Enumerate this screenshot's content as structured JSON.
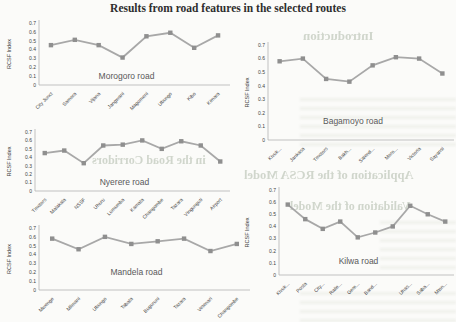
{
  "page_title": "Results from road features in the selected routes",
  "axis": {
    "ylabel": "RCSF Index",
    "ytick_values": [
      0.7,
      0.6,
      0.5,
      0.4,
      0.3,
      0.2,
      0.1,
      0
    ],
    "ytick_labels": [
      "0.7",
      "0.6",
      "0.5",
      "0.4",
      "0.3",
      "0.2",
      "0.1",
      "0"
    ],
    "ymax": 0.7
  },
  "colors": {
    "line": "#a8a8a8",
    "marker": "#8f8f8f",
    "axis_line": "#b4b4b4",
    "axis_text": "#3f3f3f",
    "chart_title_text": "#595959"
  },
  "chart_data": [
    {
      "type": "line",
      "title": "Morogoro road",
      "ylabel": "RCSF Index",
      "ylim": [
        0,
        0.7
      ],
      "grid": false,
      "legend": false,
      "categories": [
        "City Junct",
        "Samora",
        "Vijana",
        "Jangwani",
        "Magomeni",
        "Ubungo",
        "Kibo",
        "Kimara"
      ],
      "values": [
        0.45,
        0.51,
        0.45,
        0.31,
        0.55,
        0.59,
        0.42,
        0.56
      ]
    },
    {
      "type": "line",
      "title": "Bagamoyo road",
      "ylabel": "RCSF Index",
      "ylim": [
        0,
        0.7
      ],
      "grid": false,
      "legend": false,
      "categories": [
        "Kivuk...",
        "Jankasa",
        "Tmotors",
        "Bakh...",
        "Salend...",
        "Moro...",
        "Victoria",
        "Sayansi"
      ],
      "values": [
        0.58,
        0.6,
        0.45,
        0.43,
        0.55,
        0.61,
        0.6,
        0.49
      ]
    },
    {
      "type": "line",
      "title": "Nyerere road",
      "ylabel": "RCSF Index",
      "ylim": [
        0,
        0.7
      ],
      "grid": false,
      "legend": false,
      "categories": [
        "Tmotors",
        "Malakala",
        "NSSF",
        "Uhuru",
        "Lumumba",
        "Kamata",
        "Changombe",
        "Tazara",
        "Vingunguti",
        "Airport"
      ],
      "values": [
        0.45,
        0.48,
        0.33,
        0.54,
        0.55,
        0.6,
        0.5,
        0.59,
        0.54,
        0.35
      ]
    },
    {
      "type": "line",
      "title": "Mandela road",
      "ylabel": "RCSF Index",
      "ylim": [
        0,
        0.7
      ],
      "grid": false,
      "legend": false,
      "categories": [
        "Mwenge",
        "Mlimani",
        "Ubungo",
        "Tabata",
        "Buguruni",
        "Tazara",
        "Vetenari",
        "Changombe"
      ],
      "values": [
        0.58,
        0.46,
        0.6,
        0.52,
        0.55,
        0.58,
        0.44,
        0.52
      ]
    },
    {
      "type": "line",
      "title": "Kilwa road",
      "ylabel": "RCSF Index",
      "ylim": [
        0,
        0.7
      ],
      "grid": false,
      "legend": false,
      "categories": [
        "Kivuk...",
        "Posta",
        "City...",
        "Raile...",
        "Gere...",
        "Band...",
        "",
        "Uhas...",
        "Saba...",
        "Mton..."
      ],
      "values": [
        0.58,
        0.46,
        0.38,
        0.44,
        0.31,
        0.35,
        0.4,
        0.57,
        0.5,
        0.44
      ]
    }
  ],
  "background_bleed": {
    "top": "Introduction",
    "mid_left": "in the Road Corridors",
    "mid_right": "Application of the RCSA Model",
    "lower": "Validation of the Model"
  }
}
